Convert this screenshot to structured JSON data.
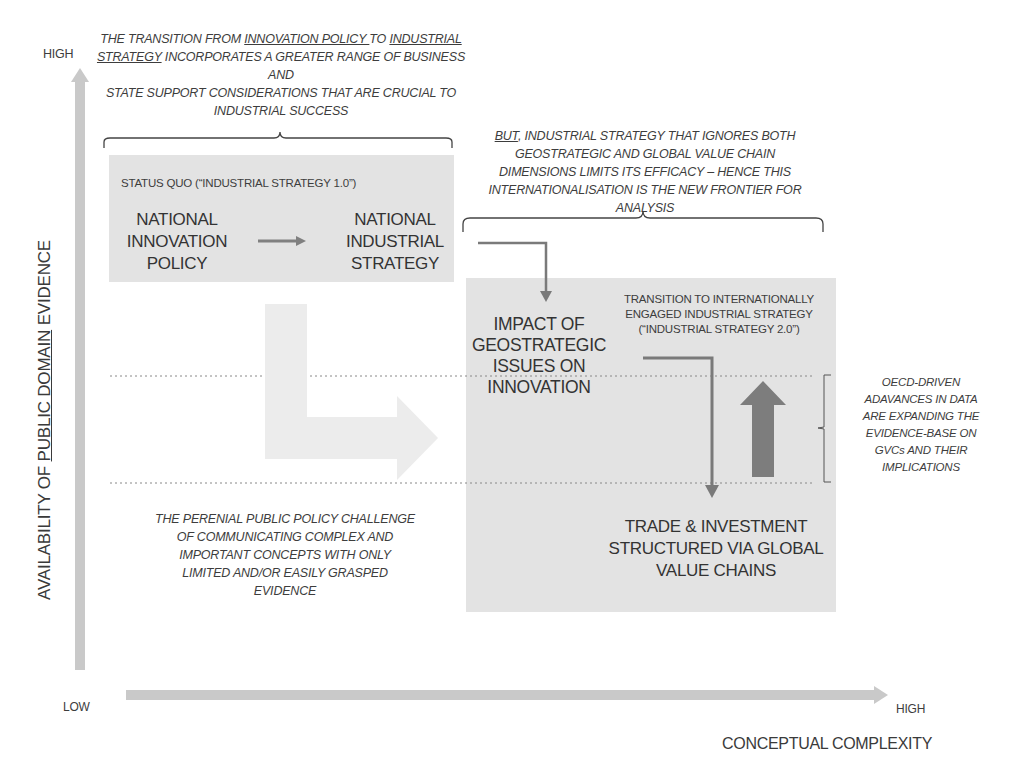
{
  "axes": {
    "y": {
      "label_pre": "AVAILABILITY OF ",
      "label_underlined": "PUBLIC DOMAIN",
      "label_post": " EVIDENCE",
      "high": "HIGH"
    },
    "x": {
      "label": "CONCEPTUAL COMPLEXITY",
      "low": "LOW",
      "high": "HIGH"
    }
  },
  "top_note": {
    "line1_pre": "THE TRANSITION FROM ",
    "line1_u1": "INNOVATION POLICY ",
    "line1_mid": "TO ",
    "line1_u2": "INDUSTRIAL",
    "line2_u": "STRATEGY",
    "line2_post": " INCORPORATES  A GREATER RANGE OF BUSINESS AND",
    "line3": "STATE SUPPORT CONSIDERATIONS THAT ARE CRUCIAL TO",
    "line4": "INDUSTRIAL SUCCESS"
  },
  "right_note": {
    "line1_u": "BUT",
    "line1_post": ", INDUSTRIAL STRATEGY THAT IGNORES BOTH",
    "line2": "GEOSTRATEGIC AND GLOBAL VALUE CHAIN",
    "line3": "DIMENSIONS LIMITS ITS EFFICACY – HENCE THIS",
    "line4": "INTERNATIONALISATION IS THE NEW FRONTIER FOR",
    "line5": "ANALYSIS"
  },
  "status_quo_box": {
    "title": "STATUS QUO (“INDUSTRIAL STRATEGY 1.0”)",
    "left": [
      "NATIONAL",
      "INNOVATION",
      "POLICY"
    ],
    "right": [
      "NATIONAL",
      "INDUSTRIAL",
      "STRATEGY"
    ]
  },
  "strategy2_box": {
    "title": [
      "TRANSITION TO INTERNATIONALLY",
      "ENGAGED INDUSTRIAL STRATEGY",
      "(“INDUSTRIAL STRATEGY 2.0”)"
    ],
    "impact": [
      "IMPACT OF",
      "GEOSTRATEGIC",
      "ISSUES ON",
      "INNOVATION"
    ],
    "trade": [
      "TRADE & INVESTMENT",
      "STRUCTURED VIA GLOBAL",
      "VALUE CHAINS"
    ]
  },
  "oecd_note": [
    "OECD-DRIVEN",
    "ADAVANCES IN DATA",
    "ARE EXPANDING THE",
    "EVIDENCE-BASE ON",
    "GVCs AND THEIR",
    "IMPLICATIONS"
  ],
  "challenge_note": [
    "THE PERENIAL PUBLIC POLICY CHALLENGE",
    "OF COMMUNICATING COMPLEX AND",
    "IMPORTANT CONCEPTS WITH ONLY",
    "LIMITED AND/OR EASILY GRASPED",
    "EVIDENCE"
  ],
  "colors": {
    "box_fill": "#e3e3e3",
    "axis_arrow": "#c9c9c9",
    "dark_arrow": "#7a7a7a",
    "light_arrow": "#ececec",
    "text": "#3a3a3a"
  }
}
